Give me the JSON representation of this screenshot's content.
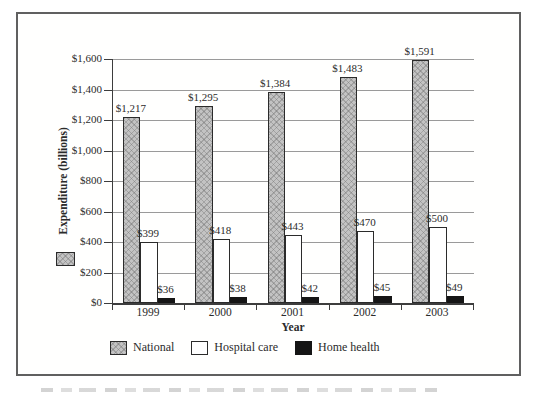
{
  "figure": {
    "background": "#ffffff",
    "border_color": "#606060"
  },
  "chart_data": {
    "type": "bar",
    "title": "",
    "categories": [
      "1999",
      "2000",
      "2001",
      "2002",
      "2003"
    ],
    "series": [
      {
        "name": "National",
        "values": [
          1217,
          1295,
          1384,
          1483,
          1591
        ],
        "value_labels": [
          "$1,217",
          "$1,295",
          "$1,384",
          "$1,483",
          "$1,591"
        ],
        "fill": "#c3c3c3",
        "pattern": "crosshatch",
        "css_class": "national"
      },
      {
        "name": "Hospital care",
        "values": [
          399,
          418,
          443,
          470,
          500
        ],
        "value_labels": [
          "$399",
          "$418",
          "$443",
          "$470",
          "$500"
        ],
        "fill": "#ffffff",
        "pattern": "none",
        "css_class": "hospital"
      },
      {
        "name": "Home health",
        "values": [
          36,
          38,
          42,
          45,
          49
        ],
        "value_labels": [
          "$36",
          "$38",
          "$42",
          "$45",
          "$49"
        ],
        "fill": "#151515",
        "pattern": "solid",
        "css_class": "home"
      }
    ],
    "xlabel": "Year",
    "ylabel": "Expenditure (billions)",
    "ylim": [
      0,
      1600
    ],
    "ytick_step": 200,
    "ytick_labels": [
      "$0",
      "$200",
      "$400",
      "$600",
      "$800",
      "$1,000",
      "$1,200",
      "$1,400",
      "$1,600"
    ],
    "grid": true,
    "gridline_color": "#9a9a9a",
    "axis_color": "#3d3d3d",
    "legend_position": "bottom",
    "legend_entries": [
      "National",
      "Hospital care",
      "Home health"
    ]
  }
}
